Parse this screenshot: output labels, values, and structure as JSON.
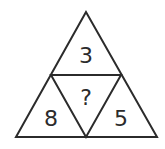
{
  "puzzle": {
    "top": "3",
    "center": "?",
    "left": "8",
    "right": "5"
  },
  "colors": {
    "stroke": "#2b2b2b",
    "background": "#ffffff"
  }
}
